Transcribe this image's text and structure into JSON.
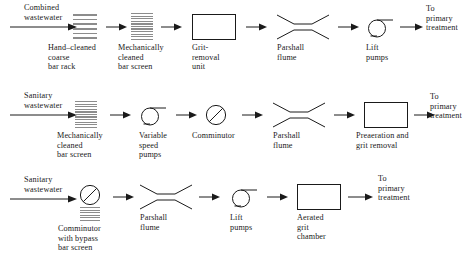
{
  "diagram": {
    "stroke_color": "#1a1a1a",
    "screen_color": "#8c8c8c",
    "background": "#ffffff",
    "rows": [
      {
        "id": "combined-wastewater-train",
        "source_label": "Combined\nwastewater",
        "outlet_label": "To\nprimary\ntreatment",
        "nodes": [
          {
            "icon": "coarse-bar-rack-icon",
            "label": "Hand–cleaned\ncoarse\nbar rack"
          },
          {
            "icon": "mechanical-bar-screen-icon",
            "label": "Mechanically\ncleaned\nbar screen"
          },
          {
            "icon": "rectangular-tank-icon",
            "label": "Grit-\nremoval\nunit"
          },
          {
            "icon": "parshall-flume-icon",
            "label": "Parshall\nflume"
          },
          {
            "icon": "lift-pump-icon",
            "label": "Lift\npumps"
          }
        ]
      },
      {
        "id": "sanitary-wastewater-train-a",
        "source_label": "Sanitary\nwastewater",
        "outlet_label": "To\nprimary\ntreatment",
        "nodes": [
          {
            "icon": "mechanical-bar-screen-icon",
            "label": "Mechanically\ncleaned\nbar screen"
          },
          {
            "icon": "lift-pump-icon",
            "label": "Variable\nspeed\npumps"
          },
          {
            "icon": "comminutor-icon",
            "label": "Comminutor"
          },
          {
            "icon": "parshall-flume-icon",
            "label": "Parshall\nflume"
          },
          {
            "icon": "rectangular-tank-icon",
            "label": "Preaeration and\ngrit removal"
          }
        ]
      },
      {
        "id": "sanitary-wastewater-train-b",
        "source_label": "Sanitary\nwastewater",
        "outlet_label": "To\nprimary\ntreatment",
        "nodes": [
          {
            "icon": "comminutor-with-bypass-screen-icon",
            "label": "Comminutor\nwith bypass\nbar screen"
          },
          {
            "icon": "parshall-flume-icon",
            "label": "Parshall\nflume"
          },
          {
            "icon": "lift-pump-icon",
            "label": "Lift\npumps"
          },
          {
            "icon": "rectangular-tank-icon",
            "label": "Aerated\ngrit\nchamber"
          }
        ]
      }
    ]
  }
}
